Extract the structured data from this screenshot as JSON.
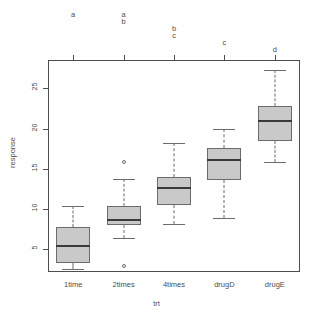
{
  "chart_data": {
    "type": "box",
    "title": "",
    "xlabel": "trt",
    "ylabel": "response",
    "categories": [
      "1time",
      "2times",
      "4times",
      "drugD",
      "drugE"
    ],
    "ylim": [
      2.2,
      28.5
    ],
    "yticks": [
      5,
      10,
      15,
      20,
      25
    ],
    "ytick_labels": [
      "5",
      "10",
      "15",
      "20",
      "25"
    ],
    "grid": false,
    "legend": null,
    "box_fill_color": "#c9c9c9",
    "box_line_color": "#6b6b6b",
    "median_color": "#3a3a3a",
    "axis_color": "#4d4d4d",
    "boxes": [
      {
        "category": "1time",
        "whisker_low": 2.6,
        "q1": 3.3,
        "median": 5.4,
        "q3": 7.8,
        "whisker_high": 10.4,
        "outliers": [],
        "letters": [
          "a"
        ]
      },
      {
        "category": "2times",
        "whisker_low": 6.4,
        "q1": 8.0,
        "median": 8.7,
        "q3": 10.4,
        "whisker_high": 13.7,
        "outliers": [
          15.8,
          3.0
        ],
        "letters": [
          "a",
          "b"
        ]
      },
      {
        "category": "4times",
        "whisker_low": 8.2,
        "q1": 10.5,
        "median": 12.6,
        "q3": 14.0,
        "whisker_high": 18.2,
        "outliers": [],
        "letters": [
          "b",
          "c"
        ]
      },
      {
        "category": "drugD",
        "whisker_low": 8.9,
        "q1": 13.6,
        "median": 16.1,
        "q3": 17.6,
        "whisker_high": 20.0,
        "outliers": [],
        "letters": [
          "c"
        ]
      },
      {
        "category": "drugE",
        "whisker_low": 15.8,
        "q1": 18.4,
        "median": 20.9,
        "q3": 22.8,
        "whisker_high": 27.2,
        "outliers": [],
        "letters": [
          "d"
        ]
      }
    ],
    "significance_letters": [
      {
        "category": "1time",
        "letter": "a",
        "row": 0
      },
      {
        "category": "2times",
        "letter": "a",
        "row": 0
      },
      {
        "category": "2times",
        "letter": "b",
        "row": 1
      },
      {
        "category": "4times",
        "letter": "b",
        "row": 2
      },
      {
        "category": "4times",
        "letter": "c",
        "row": 3
      },
      {
        "category": "drugD",
        "letter": "c",
        "row": 4
      },
      {
        "category": "drugE",
        "letter": "d",
        "row": 5
      }
    ]
  }
}
